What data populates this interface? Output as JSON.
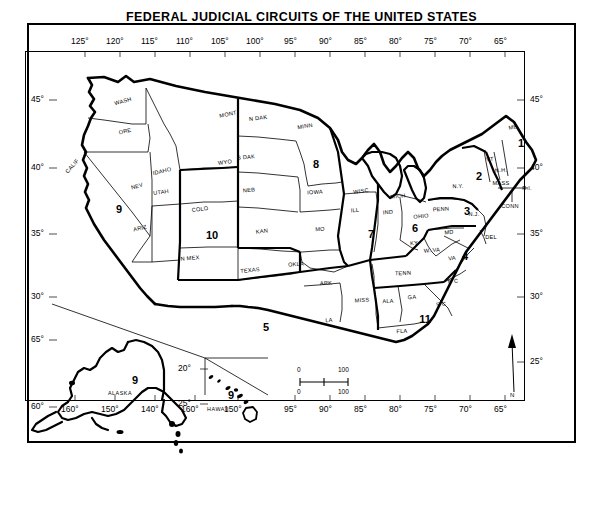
{
  "title": "FEDERAL JUDICIAL CIRCUITS OF THE UNITED STATES",
  "axes": {
    "top_longitudes": [
      "125°",
      "120°",
      "115°",
      "110°",
      "105°",
      "100°",
      "95°",
      "90°",
      "85°",
      "80°",
      "75°",
      "70°",
      "65°"
    ],
    "bottom_longitudes": [
      "160°",
      "150°",
      "140°",
      "160°",
      "150°",
      "95°",
      "90°",
      "85°",
      "80°",
      "75°",
      "70°",
      "65°"
    ],
    "left_latitudes": [
      "45°",
      "40°",
      "35°",
      "30°",
      "65°",
      "60°"
    ],
    "right_latitudes": [
      "45°",
      "40°",
      "35°",
      "30°",
      "25°"
    ],
    "inset_latitudes": [
      "20°",
      "25°"
    ]
  },
  "states": [
    {
      "abbr": "WASH",
      "x": 123,
      "y": 101,
      "rot": -16
    },
    {
      "abbr": "ORE",
      "x": 125,
      "y": 131,
      "rot": -13
    },
    {
      "abbr": "CALIF",
      "x": 72,
      "y": 166,
      "rot": -48
    },
    {
      "abbr": "NEV",
      "x": 137,
      "y": 186,
      "rot": -16
    },
    {
      "abbr": "IDAHO",
      "x": 162,
      "y": 171,
      "rot": -13
    },
    {
      "abbr": "UTAH",
      "x": 161,
      "y": 192,
      "rot": -8
    },
    {
      "abbr": "ARIZ",
      "x": 140,
      "y": 228,
      "rot": -13
    },
    {
      "abbr": "MONT",
      "x": 228,
      "y": 114,
      "rot": -11
    },
    {
      "abbr": "WYO",
      "x": 225,
      "y": 162,
      "rot": -8
    },
    {
      "abbr": "COLO",
      "x": 200,
      "y": 209,
      "rot": -7
    },
    {
      "abbr": "N MEX",
      "x": 190,
      "y": 258,
      "rot": -5
    },
    {
      "abbr": "N  DAK",
      "x": 258,
      "y": 118,
      "rot": -7
    },
    {
      "abbr": "S  DAK",
      "x": 246,
      "y": 157,
      "rot": -5
    },
    {
      "abbr": "NEB",
      "x": 249,
      "y": 190,
      "rot": -4
    },
    {
      "abbr": "KAN",
      "x": 262,
      "y": 231,
      "rot": -6
    },
    {
      "abbr": "OKLA",
      "x": 296,
      "y": 264,
      "rot": -3
    },
    {
      "abbr": "TEXAS",
      "x": 250,
      "y": 270,
      "rot": -6
    },
    {
      "abbr": "MINN",
      "x": 305,
      "y": 126,
      "rot": -9
    },
    {
      "abbr": "IOWA",
      "x": 315,
      "y": 192,
      "rot": -3
    },
    {
      "abbr": "MO",
      "x": 320,
      "y": 229,
      "rot": -4
    },
    {
      "abbr": "ARK",
      "x": 326,
      "y": 283,
      "rot": -3
    },
    {
      "abbr": "LA",
      "x": 329,
      "y": 320,
      "rot": -3
    },
    {
      "abbr": "WISC",
      "x": 361,
      "y": 191,
      "rot": -7
    },
    {
      "abbr": "ILL",
      "x": 355,
      "y": 210,
      "rot": -6
    },
    {
      "abbr": "MICH",
      "x": 398,
      "y": 196,
      "rot": -6
    },
    {
      "abbr": "IND",
      "x": 388,
      "y": 212,
      "rot": -5
    },
    {
      "abbr": "OHIO",
      "x": 421,
      "y": 216,
      "rot": -5
    },
    {
      "abbr": "KY",
      "x": 414,
      "y": 243,
      "rot": -4
    },
    {
      "abbr": "TENN",
      "x": 403,
      "y": 273,
      "rot": -2
    },
    {
      "abbr": "MISS",
      "x": 362,
      "y": 300,
      "rot": -3
    },
    {
      "abbr": "ALA",
      "x": 388,
      "y": 301,
      "rot": -3
    },
    {
      "abbr": "GA",
      "x": 412,
      "y": 297,
      "rot": -3
    },
    {
      "abbr": "FLA",
      "x": 402,
      "y": 331,
      "rot": -2
    },
    {
      "abbr": "S C",
      "x": 441,
      "y": 304,
      "rot": -6
    },
    {
      "abbr": "N C",
      "x": 453,
      "y": 281,
      "rot": -7
    },
    {
      "abbr": "VA",
      "x": 452,
      "y": 258,
      "rot": -6
    },
    {
      "abbr": "W. VA",
      "x": 432,
      "y": 250,
      "rot": -5
    },
    {
      "abbr": "MD",
      "x": 449,
      "y": 232,
      "rot": -6
    },
    {
      "abbr": "DEL",
      "x": 491,
      "y": 237,
      "rot": 0
    },
    {
      "abbr": "PENN",
      "x": 441,
      "y": 209,
      "rot": -4
    },
    {
      "abbr": "N.J.",
      "x": 474,
      "y": 214,
      "rot": 0
    },
    {
      "abbr": "N.Y.",
      "x": 458,
      "y": 186,
      "rot": -2
    },
    {
      "abbr": "VT",
      "x": 490,
      "y": 159,
      "rot": -6
    },
    {
      "abbr": "N.H.",
      "x": 501,
      "y": 170,
      "rot": -4
    },
    {
      "abbr": "MASS",
      "x": 501,
      "y": 183,
      "rot": 0
    },
    {
      "abbr": "R.I.",
      "x": 527,
      "y": 188,
      "rot": 0
    },
    {
      "abbr": "CONN",
      "x": 510,
      "y": 206,
      "rot": 0
    },
    {
      "abbr": "ME",
      "x": 513,
      "y": 127,
      "rot": -11
    }
  ],
  "circuits": [
    {
      "number": "1",
      "x": 521,
      "y": 143
    },
    {
      "number": "2",
      "x": 479,
      "y": 176
    },
    {
      "number": "3",
      "x": 467,
      "y": 211
    },
    {
      "number": "4",
      "x": 465,
      "y": 256
    },
    {
      "number": "5",
      "x": 266,
      "y": 327
    },
    {
      "number": "6",
      "x": 415,
      "y": 228
    },
    {
      "number": "7",
      "x": 371,
      "y": 234
    },
    {
      "number": "8",
      "x": 316,
      "y": 164
    },
    {
      "number": "9",
      "x": 119,
      "y": 209
    },
    {
      "number": "10",
      "x": 212,
      "y": 235
    },
    {
      "number": "11",
      "x": 425,
      "y": 319
    },
    {
      "number": "9",
      "x": 135,
      "y": 380
    },
    {
      "number": "9",
      "x": 231,
      "y": 395
    }
  ],
  "insets": [
    {
      "name": "ALASKA",
      "x": 120,
      "y": 393
    },
    {
      "name": "HAWAII",
      "x": 218,
      "y": 409
    }
  ],
  "scale_bar": {
    "left_top": "0",
    "right_top": "100",
    "left_bottom": "0",
    "right_bottom": "100"
  },
  "compass": {
    "label": "N"
  },
  "colors": {
    "ink": "#000000",
    "paper": "#ffffff",
    "frame": "#000000"
  }
}
